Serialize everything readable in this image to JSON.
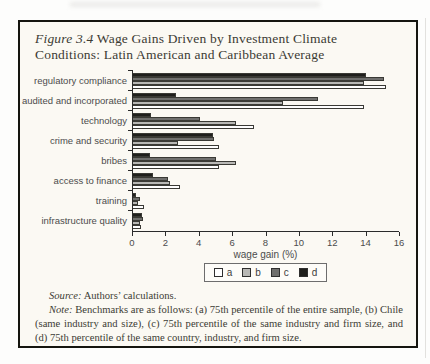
{
  "figure": {
    "title_prefix": "Figure 3.4",
    "title_rest": " Wage Gains Driven by Investment Climate Conditions: Latin American and Caribbean Average"
  },
  "chart_data": {
    "type": "bar",
    "orientation": "horizontal",
    "title": "Figure 3.4 Wage Gains Driven by Investment Climate Conditions: Latin American and Caribbean Average",
    "categories": [
      "regulatory compliance",
      "audited and incorporated",
      "technology",
      "crime and security",
      "bribes",
      "access to finance",
      "training",
      "infrastructure quality"
    ],
    "series_display_order_top_to_bottom": [
      "d",
      "c",
      "b",
      "a"
    ],
    "series": [
      {
        "name": "d",
        "color": "#1f1f1c",
        "values": [
          14.0,
          2.6,
          1.1,
          4.8,
          1.0,
          1.2,
          0.2,
          0.55
        ]
      },
      {
        "name": "c",
        "color": "#6f6f6d",
        "values": [
          15.1,
          11.1,
          4.0,
          4.9,
          5.0,
          2.1,
          0.45,
          0.6
        ]
      },
      {
        "name": "b",
        "color": "#b8b8b5",
        "values": [
          13.9,
          9.0,
          6.2,
          2.7,
          6.2,
          2.2,
          0.3,
          0.4
        ]
      },
      {
        "name": "a",
        "color": "#ffffff",
        "values": [
          15.2,
          13.9,
          7.3,
          5.2,
          5.2,
          2.8,
          0.65,
          0.5
        ]
      }
    ],
    "xlabel": "wage gain (%)",
    "xlim": [
      0,
      16
    ],
    "xticks": [
      0,
      2,
      4,
      6,
      8,
      10,
      12,
      14,
      16
    ],
    "grid": false,
    "legend": {
      "position": "bottom",
      "order": [
        "a",
        "b",
        "c",
        "d"
      ]
    }
  },
  "footer": {
    "source_label": "Source:",
    "source_text": " Authors’ calculations.",
    "note_label": "Note:",
    "note_text": " Benchmarks are as follows: (a) 75th percentile of the entire sample, (b) Chile (same industry and size), (c) 75th percentile of the same industry and firm size, and (d) 75th percentile of the same country, industry, and firm size."
  },
  "colors": {
    "frame_border": "#15150f",
    "figure_background": "#fbf9f3",
    "axis": "#2b2b2b",
    "label_text": "#4c4c4c",
    "title_text": "#3b3b33"
  }
}
